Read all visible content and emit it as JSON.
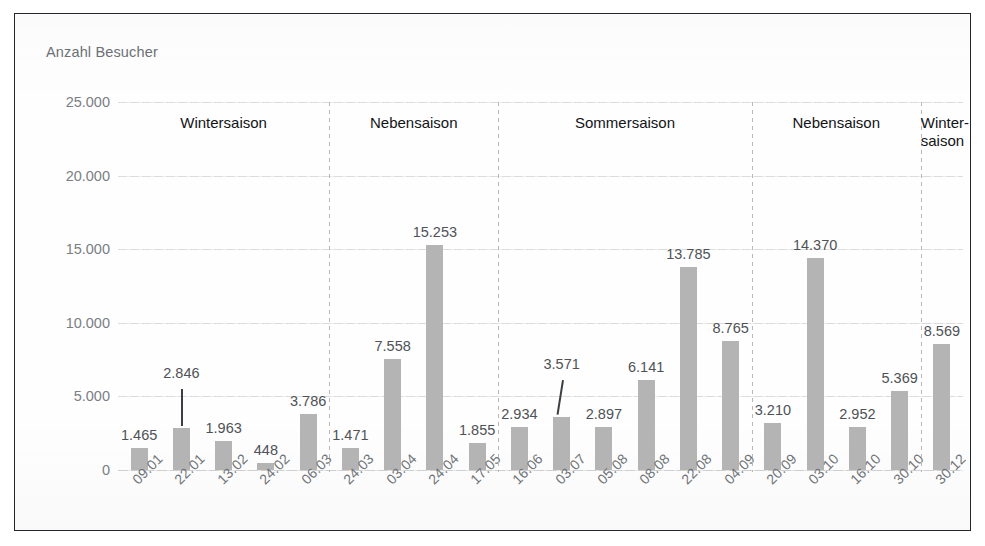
{
  "chart_title": "Anzahl Besucher",
  "chart_data": {
    "type": "bar",
    "title": "Anzahl Besucher",
    "xlabel": "",
    "ylabel": "Anzahl Besucher",
    "ylim": [
      0,
      25000
    ],
    "grid": true,
    "legend": "none",
    "yticks": [
      "25.000",
      "20.000",
      "15.000",
      "10.000",
      "5.000",
      "0"
    ],
    "ytick_values": [
      25000,
      20000,
      15000,
      10000,
      5000,
      0
    ],
    "categories": [
      "09.01",
      "22.01",
      "13.02",
      "24.02",
      "06.03",
      "24.03",
      "03.04",
      "24.04",
      "17.05",
      "16.06",
      "03.07",
      "05.08",
      "08.08",
      "22.08",
      "04.09",
      "20.09",
      "03.10",
      "16.10",
      "30.10",
      "30.12"
    ],
    "values": [
      1465,
      2846,
      1963,
      448,
      3786,
      1471,
      7558,
      15253,
      1855,
      2934,
      3571,
      2897,
      6141,
      13785,
      8765,
      3210,
      14370,
      2952,
      5369,
      8569
    ],
    "value_labels": [
      "1.465",
      "2.846",
      "1.963",
      "448",
      "3.786",
      "1.471",
      "7.558",
      "15.253",
      "1.855",
      "2.934",
      "3.571",
      "2.897",
      "6.141",
      "13.785",
      "8.765",
      "3.210",
      "14.370",
      "2.952",
      "5.369",
      "8.569"
    ],
    "bar_color": "#b4b4b4",
    "seasons": [
      {
        "label": "Wintersaison",
        "start_index": 0,
        "end_index": 4
      },
      {
        "label": "Nebensaison",
        "start_index": 5,
        "end_index": 8
      },
      {
        "label": "Sommersaison",
        "start_index": 9,
        "end_index": 14
      },
      {
        "label": "Nebensaison",
        "start_index": 15,
        "end_index": 18
      },
      {
        "label": "Winter-\nsaison",
        "start_index": 19,
        "end_index": 19
      }
    ]
  }
}
